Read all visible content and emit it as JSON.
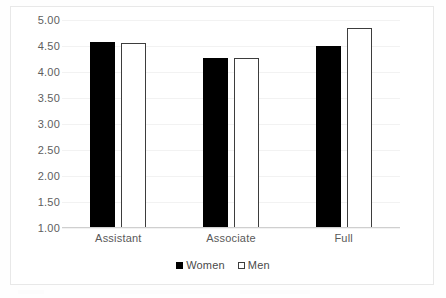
{
  "chart_data": {
    "type": "bar",
    "title": "",
    "subtitle": "",
    "xlabel": "",
    "ylabel": "",
    "categories": [
      "Assistant",
      "Associate",
      "Full"
    ],
    "series": [
      {
        "name": "Women",
        "values": [
          4.58,
          4.27,
          4.5
        ],
        "color": "#000000",
        "style": "filled"
      },
      {
        "name": "Men",
        "values": [
          4.56,
          4.27,
          4.85
        ],
        "color": "#ffffff",
        "style": "outlined"
      }
    ],
    "ylim": [
      1.0,
      5.0
    ],
    "ytick_values": [
      5.0,
      4.5,
      4.0,
      3.5,
      3.0,
      2.5,
      2.0,
      1.5,
      1.0
    ],
    "ytick_labels": [
      "5.00",
      "4.50",
      "4.00",
      "3.50",
      "3.00",
      "2.50",
      "2.00",
      "1.50",
      "1.00"
    ],
    "grid": true,
    "grid_color": "#f2f2f2",
    "legend_position": "bottom",
    "legend_entries": [
      "Women",
      "Men"
    ],
    "axis_line_color": "#cfcfcf",
    "plot_background": "#ffffff",
    "frame_color": "#e8e8e8"
  },
  "legend": {
    "items": [
      {
        "label": "Women",
        "swatch": "filled-square-icon"
      },
      {
        "label": "Men",
        "swatch": "hollow-square-icon"
      }
    ]
  }
}
